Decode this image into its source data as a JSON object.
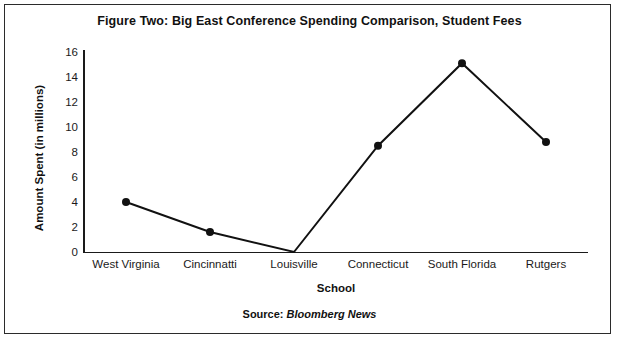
{
  "figure": {
    "title": "Figure Two: Big East Conference Spending Comparison, Student Fees",
    "source_prefix": "Source:",
    "source_name": "Bloomberg News",
    "frame_color": "#2b2b2b",
    "line_color": "#111111",
    "marker_color": "#111111",
    "background": "#ffffff"
  },
  "chart_data": {
    "type": "line",
    "title": "Figure Two: Big East Conference Spending Comparison, Student Fees",
    "xlabel": "School",
    "ylabel": "Amount Spent (in millions)",
    "categories": [
      "West Virginia",
      "Cincinnatti",
      "Louisville",
      "Connecticut",
      "South Florida",
      "Rutgers"
    ],
    "values": [
      4.0,
      1.6,
      0.0,
      8.5,
      15.1,
      8.8
    ],
    "series": [
      {
        "name": "Student Fees",
        "values": [
          4.0,
          1.6,
          0.0,
          8.5,
          15.1,
          8.8
        ]
      }
    ],
    "ylim": [
      0,
      16
    ],
    "yticks": [
      0,
      2,
      4,
      6,
      8,
      10,
      12,
      14,
      16
    ],
    "ytick_labels": [
      "0",
      "2",
      "4",
      "6",
      "8",
      "10",
      "12",
      "14",
      "16"
    ],
    "grid": false,
    "legend": false,
    "markers": "filled-circle",
    "source": "Source: Bloomberg News"
  }
}
